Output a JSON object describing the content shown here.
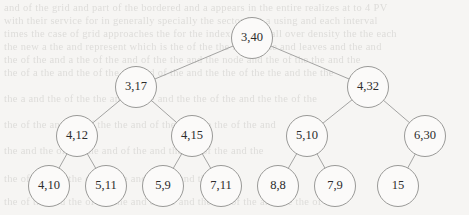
{
  "figure": {
    "kind": "binary-tree-diagram",
    "background_color": "#f6f5f3",
    "node_fill": "#fbfaf9",
    "node_stroke": "#8e8e8c",
    "edge_color": "#9a9a98",
    "label_color": "#2c2c2c"
  },
  "chart_data": {
    "type": "diagram",
    "title": "",
    "nodes": [
      {
        "id": "n0",
        "label": "3,40",
        "cx": 252,
        "cy": 38,
        "r": 20.5,
        "level": 0
      },
      {
        "id": "n1",
        "label": "3,17",
        "cx": 136,
        "cy": 87,
        "r": 20.5,
        "level": 1
      },
      {
        "id": "n2",
        "label": "4,32",
        "cx": 368,
        "cy": 87,
        "r": 20.5,
        "level": 1
      },
      {
        "id": "n3",
        "label": "4,12",
        "cx": 77,
        "cy": 136,
        "r": 20.5,
        "level": 2
      },
      {
        "id": "n4",
        "label": "4,15",
        "cx": 192,
        "cy": 136,
        "r": 20.5,
        "level": 2
      },
      {
        "id": "n5",
        "label": "5,10",
        "cx": 307,
        "cy": 136,
        "r": 20.5,
        "level": 2
      },
      {
        "id": "n6",
        "label": "6,30",
        "cx": 425,
        "cy": 136,
        "r": 20.5,
        "level": 2
      },
      {
        "id": "n7",
        "label": "4,10",
        "cx": 49,
        "cy": 186,
        "r": 20.5,
        "level": 3
      },
      {
        "id": "n8",
        "label": "5,11",
        "cx": 106,
        "cy": 186,
        "r": 20.5,
        "level": 3
      },
      {
        "id": "n9",
        "label": "5,9",
        "cx": 163,
        "cy": 186,
        "r": 20.5,
        "level": 3
      },
      {
        "id": "n10",
        "label": "7,11",
        "cx": 221,
        "cy": 186,
        "r": 20.5,
        "level": 3
      },
      {
        "id": "n11",
        "label": "8,8",
        "cx": 278,
        "cy": 186,
        "r": 20.5,
        "level": 3
      },
      {
        "id": "n12",
        "label": "7,9",
        "cx": 335,
        "cy": 186,
        "r": 20.5,
        "level": 3
      },
      {
        "id": "n13",
        "label": "15",
        "cx": 398,
        "cy": 186,
        "r": 20.5,
        "level": 3
      }
    ],
    "edges": [
      {
        "from": "n0",
        "to": "n1"
      },
      {
        "from": "n0",
        "to": "n2"
      },
      {
        "from": "n1",
        "to": "n3"
      },
      {
        "from": "n1",
        "to": "n4"
      },
      {
        "from": "n2",
        "to": "n5"
      },
      {
        "from": "n2",
        "to": "n6"
      },
      {
        "from": "n3",
        "to": "n7"
      },
      {
        "from": "n3",
        "to": "n8"
      },
      {
        "from": "n4",
        "to": "n9"
      },
      {
        "from": "n4",
        "to": "n10"
      },
      {
        "from": "n5",
        "to": "n11"
      },
      {
        "from": "n5",
        "to": "n12"
      },
      {
        "from": "n6",
        "to": "n13"
      }
    ]
  },
  "ghost_text": {
    "note": "faint bleed-through text from reverse of scanned page (illegible)",
    "lines": [
      {
        "top": 2,
        "text": "and of the grid and part of the  bordered  and a  appears  in  the entire  realizes  at  to 4 PV"
      },
      {
        "top": 15,
        "text": "with  their  service  for  in  generally  specially  the  sector  last  a  using  and  each  interval"
      },
      {
        "top": 28,
        "text": "times  the  case  of  grid  approaches  the  for  the  index  optimal  all  over  density  the  the  each"
      },
      {
        "top": 41,
        "text": "the  new  a  the  and  represent  which  is  the  of  the  the  last  of  the  and  leaves  and  the  and"
      },
      {
        "top": 54,
        "text": "the  of  the  and  a  the  of  the  and  of  the  the  and  the  node  and  the  of  the  the  and  the"
      },
      {
        "top": 67,
        "text": "the  of  a  the  and  the  of  the  the  and  of  the  and  the  the  of  the  the  and  the  the"
      },
      {
        "top": 93,
        "text": "the  a  and  the  of  the  the  and  of  the  and  the  the  of  the  and  the  the  of  the"
      },
      {
        "top": 119,
        "text": "the  of  the  and  the  of  the  the  and  of  the  and  the  the  of  the  and"
      },
      {
        "top": 145,
        "text": "the  and  the  of  the  the  and  of  the  and  the  the  of  the  and  the"
      },
      {
        "top": 173,
        "text": "the  of  the  and  the  of  the  the  and  of  the  and  the"
      },
      {
        "top": 196,
        "text": "the  of  the  and  the  of  the  the  and  of  the  and  the  the  of  the  and  the  the  of"
      }
    ]
  }
}
